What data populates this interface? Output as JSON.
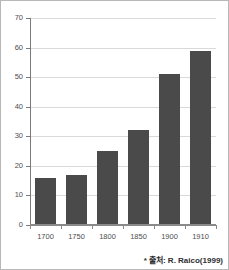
{
  "chart_data": {
    "type": "bar",
    "title": "",
    "xlabel": "",
    "ylabel": "",
    "categories": [
      "1700",
      "1750",
      "1800",
      "1850",
      "1900",
      "1910"
    ],
    "values": [
      16,
      17,
      25,
      32,
      51,
      59
    ],
    "series": [
      {
        "name": "",
        "values": [
          16,
          17,
          25,
          32,
          51,
          59
        ]
      }
    ],
    "ylim": [
      0,
      70
    ],
    "yticks": [
      "0",
      "10",
      "20",
      "30",
      "40",
      "50",
      "60",
      "70"
    ],
    "ytick_values": [
      0,
      10,
      20,
      30,
      40,
      50,
      60,
      70
    ],
    "grid": true,
    "legend": false,
    "legend_position": "none",
    "bar_color": "#4a4a4a",
    "gridline_color": "#d9d9d9",
    "axis_color": "#7a7a7a",
    "background_color": "#ffffff",
    "annotations": [
      {
        "name": "source-note",
        "text": "* 출처: R. Raico(1999)",
        "position": "bottom-right"
      }
    ]
  },
  "figure": {
    "border_color": "#b8b8b8",
    "source_note": "* 출처: R. Raico(1999)"
  }
}
